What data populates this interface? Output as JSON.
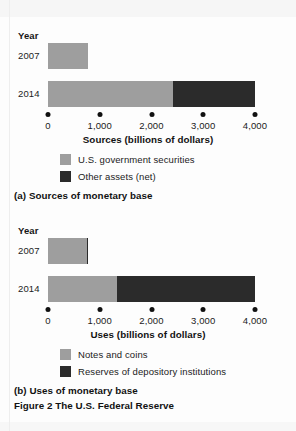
{
  "figure": {
    "caption": "Figure 2  The U.S. Federal Reserve"
  },
  "panels": [
    {
      "id": "a",
      "caption": "(a) Sources of monetary base",
      "year_axis_label": "Year",
      "axis_title": "Sources (billions of dollars)",
      "legend": [
        {
          "label": "U.S. government securities",
          "color": "#9e9e9e"
        },
        {
          "label": "Other assets (net)",
          "color": "#2b2b2b"
        }
      ],
      "rows": [
        {
          "label": "2007"
        },
        {
          "label": "2014"
        }
      ],
      "ticks": [
        "0",
        "1,000",
        "2,000",
        "3,000",
        "4,000"
      ]
    },
    {
      "id": "b",
      "caption": "(b) Uses of monetary base",
      "year_axis_label": "Year",
      "axis_title": "Uses (billions of dollars)",
      "legend": [
        {
          "label": "Notes and coins",
          "color": "#9e9e9e"
        },
        {
          "label": "Reserves of depository institutions",
          "color": "#2b2b2b"
        }
      ],
      "rows": [
        {
          "label": "2007"
        },
        {
          "label": "2014"
        }
      ],
      "ticks": [
        "0",
        "1,000",
        "2,000",
        "3,000",
        "4,000"
      ]
    }
  ],
  "chart_data": [
    {
      "type": "bar",
      "orientation": "horizontal",
      "stacked": true,
      "title": "(a) Sources of monetary base",
      "xlabel": "Sources (billions of dollars)",
      "ylabel": "Year",
      "categories": [
        "2007",
        "2014"
      ],
      "xlim": [
        0,
        4000
      ],
      "xticks": [
        0,
        1000,
        2000,
        3000,
        4000
      ],
      "xticklabels": [
        "0",
        "1,000",
        "2,000",
        "3,000",
        "4,000"
      ],
      "grid": false,
      "legend_position": "below-axis",
      "series": [
        {
          "name": "U.S. government securities",
          "color": "#9e9e9e",
          "values": [
            770,
            2415
          ]
        },
        {
          "name": "Other assets (net)",
          "color": "#2b2b2b",
          "values": [
            0,
            1585
          ]
        }
      ],
      "totals": [
        770,
        4000
      ]
    },
    {
      "type": "bar",
      "orientation": "horizontal",
      "stacked": true,
      "title": "(b) Uses of monetary base",
      "xlabel": "Uses (billions of dollars)",
      "ylabel": "Year",
      "categories": [
        "2007",
        "2014"
      ],
      "xlim": [
        0,
        4000
      ],
      "xticks": [
        0,
        1000,
        2000,
        3000,
        4000
      ],
      "xticklabels": [
        "0",
        "1,000",
        "2,000",
        "3,000",
        "4,000"
      ],
      "grid": false,
      "legend_position": "below-axis",
      "series": [
        {
          "name": "Notes and coins",
          "color": "#9e9e9e",
          "values": [
            750,
            1335
          ]
        },
        {
          "name": "Reserves of depository institutions",
          "color": "#2b2b2b",
          "values": [
            30,
            2665
          ]
        }
      ],
      "totals": [
        780,
        4000
      ]
    }
  ],
  "axis_geometry": {
    "x0_px": 48,
    "px_per_unit": 0.05175
  }
}
